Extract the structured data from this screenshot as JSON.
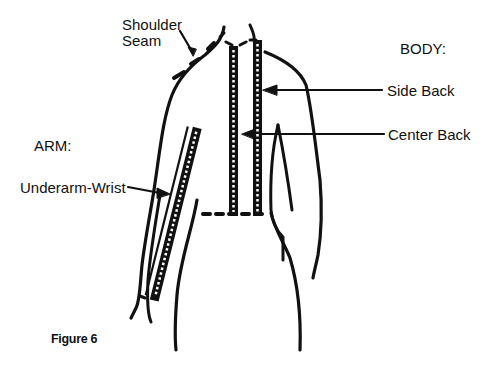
{
  "figure": {
    "caption": "Figure 6",
    "sections": {
      "body": "BODY:",
      "arm": "ARM:"
    },
    "labels": {
      "shoulder_seam_line1": "Shoulder",
      "shoulder_seam_line2": "Seam",
      "side_back": "Side Back",
      "center_back": "Center Back",
      "underarm_wrist": "Underarm-Wrist"
    },
    "colors": {
      "ink": "#111111",
      "background": "#ffffff"
    }
  }
}
